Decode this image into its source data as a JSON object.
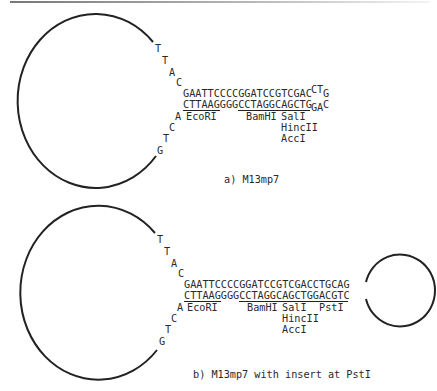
{
  "panel_a": {
    "caption": "a) M13mp7",
    "loop_top_bases": [
      "T",
      "T",
      "A",
      "C"
    ],
    "loop_bottom_bases": [
      "A",
      "C",
      "T",
      "G"
    ],
    "top_strand": "GAATTCCCCGGATCCGTCGAC",
    "top_strand_tail": [
      "C",
      "T",
      "G"
    ],
    "bottom_strand": "CTTAAGGGGCCTAGGCAGCTG",
    "bottom_strand_tail": [
      "G",
      "A",
      "C"
    ],
    "sites": [
      {
        "name": "EcoRI"
      },
      {
        "name": "BamHI"
      },
      {
        "name": "SalI",
        "also": [
          "HincII",
          "AccI"
        ]
      }
    ]
  },
  "panel_b": {
    "caption": "b) M13mp7 with insert at PstI",
    "loop_top_bases": [
      "T",
      "T",
      "A",
      "C"
    ],
    "loop_bottom_bases": [
      "A",
      "C",
      "T",
      "G"
    ],
    "top_strand": "GAATTCCCCGGATCCGTCGACCTGCAG",
    "bottom_strand": "CTTAAGGGGCCTAGGCAGCTGGACGTC",
    "sites": [
      {
        "name": "EcoRI"
      },
      {
        "name": "BamHI"
      },
      {
        "name": "SalI",
        "also": [
          "HincII",
          "AccI"
        ]
      },
      {
        "name": "PstI"
      }
    ]
  },
  "colors": {
    "ink": "#2a2a2a",
    "background": "#ffffff"
  }
}
